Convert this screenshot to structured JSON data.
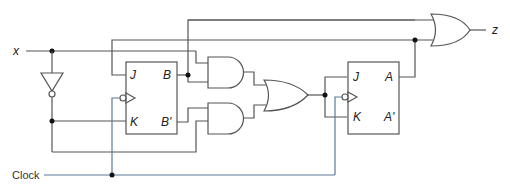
{
  "diagram": {
    "type": "sequential-logic-circuit",
    "inputs": {
      "x": "x",
      "clock": "Clock"
    },
    "output": {
      "z": "z"
    },
    "flipflop_b": {
      "pins": {
        "j": "J",
        "k": "K",
        "q": "B",
        "q_bar": "B'"
      }
    },
    "flipflop_a": {
      "pins": {
        "j": "J",
        "k": "K",
        "q": "A",
        "q_bar": "A'"
      }
    },
    "colors": {
      "wire": "#555555",
      "clock_wire": "#5b7a99",
      "junction": "#111111"
    }
  }
}
